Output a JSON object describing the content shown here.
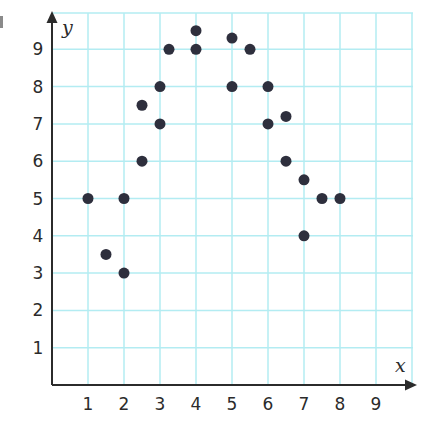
{
  "chart_data": {
    "type": "scatter",
    "title": "",
    "xlabel": "x",
    "ylabel": "y",
    "xlim": [
      0,
      10
    ],
    "ylim": [
      0,
      10
    ],
    "x_ticks": [
      1,
      2,
      3,
      4,
      5,
      6,
      7,
      8,
      9
    ],
    "y_ticks": [
      1,
      2,
      3,
      4,
      5,
      6,
      7,
      8,
      9
    ],
    "grid": true,
    "legend": null,
    "series": [
      {
        "name": "points",
        "points": [
          {
            "x": 1,
            "y": 5
          },
          {
            "x": 1.5,
            "y": 3.5
          },
          {
            "x": 2,
            "y": 5
          },
          {
            "x": 2,
            "y": 3
          },
          {
            "x": 2.5,
            "y": 7.5
          },
          {
            "x": 2.5,
            "y": 6
          },
          {
            "x": 3,
            "y": 8
          },
          {
            "x": 3,
            "y": 7
          },
          {
            "x": 3.25,
            "y": 9
          },
          {
            "x": 4,
            "y": 9.5
          },
          {
            "x": 4,
            "y": 9
          },
          {
            "x": 5,
            "y": 9.3
          },
          {
            "x": 5,
            "y": 8
          },
          {
            "x": 5.5,
            "y": 9
          },
          {
            "x": 6,
            "y": 8
          },
          {
            "x": 6,
            "y": 7
          },
          {
            "x": 6.5,
            "y": 7.2
          },
          {
            "x": 6.5,
            "y": 6
          },
          {
            "x": 7,
            "y": 5.5
          },
          {
            "x": 7,
            "y": 4
          },
          {
            "x": 7.5,
            "y": 5
          },
          {
            "x": 8,
            "y": 5
          }
        ]
      }
    ]
  },
  "colors": {
    "grid": "#b3ecf2",
    "axis": "#2b2b2b",
    "point": "#2e2f3d",
    "background": "#ffffff"
  }
}
